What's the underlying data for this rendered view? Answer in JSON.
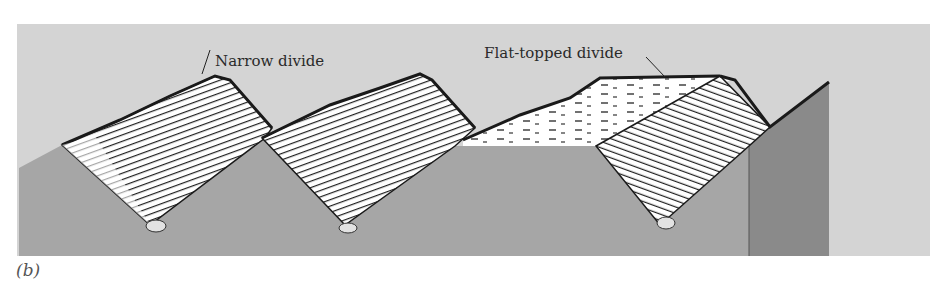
{
  "figure": {
    "panel_label": "(b)",
    "labels": {
      "narrow_divide": "Narrow divide",
      "flat_topped_divide": "Flat-topped divide"
    },
    "colors": {
      "sky": "#d4d4d4",
      "ground": "#a6a6a6",
      "ground_dark": "#8a8a8a",
      "slope_fill": "#ffffff",
      "hatch": "#1e1e1e",
      "outline": "#1a1a1a",
      "stream": "#e2e2e2"
    }
  }
}
